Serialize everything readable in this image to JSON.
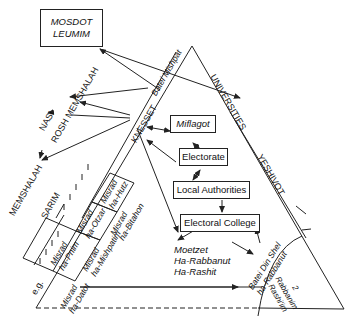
{
  "diagram": {
    "boxes": {
      "mosdot_leumim": [
        "MOSDOT",
        "LEUMIM"
      ],
      "miflagot": "Miflagot",
      "electorate": "Electorate",
      "local_authorities": "Local Authorities",
      "electoral_college": "Electoral College"
    },
    "edge_labels": {
      "batei_mishpat": "Batei Mishpat",
      "universities": "UNIVERSITIES",
      "yeshivot": "YESHIVOT",
      "knesset": "KNESSET",
      "nasi": "NASI",
      "rosh_memshalah": "ROSH MEMSHALAH",
      "memshalah": "MEMSHALAH",
      "sarim": "SARIM",
      "batei_din": [
        "Batei Din Shel",
        "ha-Rabbanut"
      ],
      "rabbanim": [
        "2",
        "Rabbanim",
        "Rashi'im"
      ],
      "eg": "e.g."
    },
    "ministries": [
      [
        "Misrad",
        "ha-Hutz"
      ],
      [
        "Misrad",
        "ha-Otzar"
      ],
      [
        "Misrad",
        "ha-Pnim"
      ],
      [
        "Misrad",
        "ha-Bitahon"
      ],
      [
        "Misrad",
        "ha-Mishpatim"
      ],
      [
        "Misrad",
        "ha-Datot"
      ]
    ],
    "moetzet": [
      "Moetzet",
      "Ha-Rabbanut",
      "Ha-Rashit"
    ],
    "colors": {
      "ink": "#222222",
      "background": "#ffffff"
    }
  }
}
